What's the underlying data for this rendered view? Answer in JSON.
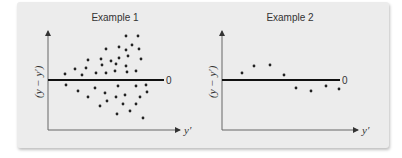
{
  "chart_data": [
    {
      "type": "scatter",
      "title": "Example 1",
      "xlabel": "y'",
      "ylabel": "(y − y')",
      "reference_line": {
        "y": 0,
        "label": "0"
      },
      "grid": false,
      "points_px": [
        [
          126,
          36
        ],
        [
          138,
          36
        ],
        [
          106,
          49
        ],
        [
          119,
          47
        ],
        [
          126,
          50
        ],
        [
          132,
          45
        ],
        [
          139,
          49
        ],
        [
          88,
          60
        ],
        [
          101,
          59
        ],
        [
          111,
          61
        ],
        [
          119,
          58
        ],
        [
          128,
          56
        ],
        [
          141,
          59
        ],
        [
          75,
          69
        ],
        [
          86,
          68
        ],
        [
          102,
          65
        ],
        [
          116,
          64
        ],
        [
          126,
          66
        ],
        [
          65,
          74
        ],
        [
          82,
          75
        ],
        [
          96,
          73
        ],
        [
          106,
          73
        ],
        [
          115,
          71
        ],
        [
          127,
          72
        ],
        [
          136,
          71
        ],
        [
          66,
          85
        ],
        [
          78,
          91
        ],
        [
          95,
          88
        ],
        [
          118,
          86
        ],
        [
          136,
          86
        ],
        [
          146,
          85
        ],
        [
          88,
          97
        ],
        [
          105,
          93
        ],
        [
          116,
          97
        ],
        [
          125,
          95
        ],
        [
          140,
          97
        ],
        [
          147,
          92
        ],
        [
          100,
          106
        ],
        [
          107,
          101
        ],
        [
          123,
          104
        ],
        [
          136,
          104
        ],
        [
          117,
          114
        ],
        [
          130,
          111
        ],
        [
          143,
          118
        ]
      ]
    },
    {
      "type": "scatter",
      "title": "Example 2",
      "xlabel": "y'",
      "ylabel": "(y − y')",
      "reference_line": {
        "y": 0,
        "label": "0"
      },
      "grid": false,
      "points_px": [
        [
          242,
          73
        ],
        [
          254,
          66
        ],
        [
          270,
          65
        ],
        [
          284,
          75
        ],
        [
          296,
          88
        ],
        [
          311,
          91
        ],
        [
          326,
          86
        ],
        [
          339,
          89
        ]
      ]
    }
  ],
  "charts": [
    {
      "title": "Example 1",
      "zero_label": "0",
      "xlabel": "y′",
      "ylabel": "(y − y′)"
    },
    {
      "title": "Example 2",
      "zero_label": "0",
      "xlabel": "y′",
      "ylabel": "(y − y′)"
    }
  ],
  "colors": {
    "panel": "#ececec",
    "ink": "#222222",
    "axis": "#555555"
  }
}
